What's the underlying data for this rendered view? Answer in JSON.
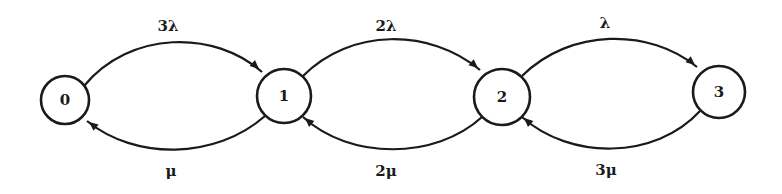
{
  "diagram": {
    "type": "state-transition-diagram",
    "colors": {
      "stroke": "#1a1a1a",
      "background": "#ffffff",
      "node_fill": "#ffffff"
    },
    "nodes": [
      {
        "id": "0",
        "label": "0",
        "cx": 65,
        "cy": 100,
        "r": 24
      },
      {
        "id": "1",
        "label": "1",
        "cx": 284,
        "cy": 96,
        "r": 27
      },
      {
        "id": "2",
        "label": "2",
        "cx": 502,
        "cy": 97,
        "r": 28
      },
      {
        "id": "3",
        "label": "3",
        "cx": 719,
        "cy": 92,
        "r": 26
      }
    ],
    "edges": [
      {
        "from": "0",
        "to": "1",
        "direction": "forward",
        "label": "3λ",
        "label_x": 168,
        "label_y": 31,
        "path": "M 84 86 C 130 30, 215 30, 262 72",
        "arrow_x": 259,
        "arrow_y": 69,
        "arrow_angle": 42
      },
      {
        "from": "1",
        "to": "0",
        "direction": "backward",
        "label": "μ",
        "label_x": 171,
        "label_y": 176,
        "path": "M 265 116 C 215 160, 135 160, 87 121",
        "arrow_x": 89,
        "arrow_y": 122,
        "arrow_angle": 218
      },
      {
        "from": "1",
        "to": "2",
        "direction": "forward",
        "label": "2λ",
        "label_x": 386,
        "label_y": 31,
        "path": "M 303 76 C 350 28, 430 28, 480 70",
        "arrow_x": 478,
        "arrow_y": 68,
        "arrow_angle": 40
      },
      {
        "from": "2",
        "to": "1",
        "direction": "backward",
        "label": "2μ",
        "label_x": 386,
        "label_y": 176,
        "path": "M 482 117 C 435 160, 350 160, 303 117",
        "arrow_x": 305,
        "arrow_y": 118,
        "arrow_angle": 222
      },
      {
        "from": "2",
        "to": "3",
        "direction": "forward",
        "label": "λ",
        "label_x": 605,
        "label_y": 28,
        "path": "M 522 76 C 570 28, 650 28, 697 67",
        "arrow_x": 695,
        "arrow_y": 65,
        "arrow_angle": 40
      },
      {
        "from": "3",
        "to": "2",
        "direction": "backward",
        "label": "3μ",
        "label_x": 606,
        "label_y": 175,
        "path": "M 700 111 C 655 160, 570 160, 522 117",
        "arrow_x": 524,
        "arrow_y": 118,
        "arrow_angle": 222
      }
    ]
  }
}
